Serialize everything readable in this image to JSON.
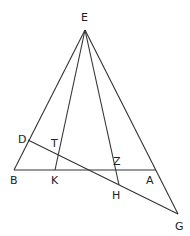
{
  "diagram": {
    "points": {
      "E": {
        "label": "E",
        "x": 85,
        "y": 30,
        "lx": 81,
        "ly": 21
      },
      "B": {
        "label": "B",
        "x": 14,
        "y": 170,
        "lx": 10,
        "ly": 184
      },
      "A": {
        "label": "A",
        "x": 156,
        "y": 170,
        "lx": 146,
        "ly": 184
      },
      "K": {
        "label": "K",
        "x": 55,
        "y": 170,
        "lx": 51,
        "ly": 184
      },
      "H": {
        "label": "H",
        "x": 119,
        "y": 185,
        "lx": 112,
        "ly": 198
      },
      "D": {
        "label": "D",
        "x": 28,
        "y": 140,
        "lx": 18,
        "ly": 142
      },
      "G": {
        "label": "G",
        "x": 178,
        "y": 214,
        "lx": 175,
        "ly": 229
      },
      "T": {
        "label": "T",
        "x": 59,
        "y": 154,
        "lx": 51,
        "ly": 146
      },
      "Z": {
        "label": "Z",
        "x": 116,
        "y": 170,
        "lx": 113,
        "ly": 164
      }
    },
    "segments": [
      [
        "E",
        "B"
      ],
      [
        "E",
        "K"
      ],
      [
        "E",
        "H"
      ],
      [
        "E",
        "G"
      ],
      [
        "B",
        "A"
      ],
      [
        "D",
        "G"
      ]
    ]
  }
}
